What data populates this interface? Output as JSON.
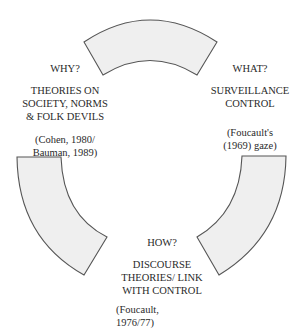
{
  "diagram": {
    "type": "cycle",
    "segment_fill": "#efefef",
    "segment_stroke": "#555555",
    "nodes": [
      {
        "id": "why",
        "question": "WHY?",
        "title_lines": [
          "THEORIES ON",
          "SOCIETY, NORMS",
          "& FOLK DEVILS"
        ],
        "citation_lines": [
          "(Cohen, 1980/",
          "Bauman, 1989)"
        ]
      },
      {
        "id": "what",
        "question": "WHAT?",
        "title_lines": [
          "SURVEILLANCE",
          "CONTROL"
        ],
        "citation_lines": [
          "(Foucault's",
          "(1969) gaze)"
        ]
      },
      {
        "id": "how",
        "question": "HOW?",
        "title_lines": [
          "DISCOURSE",
          "THEORIES/ LINK",
          "WITH CONTROL"
        ],
        "citation_lines": [
          "(Foucault,",
          "1976/77)"
        ]
      }
    ]
  }
}
